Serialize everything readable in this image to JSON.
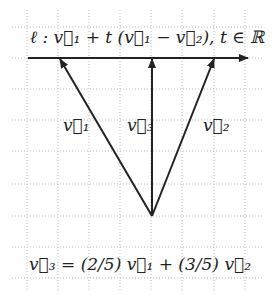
{
  "diagram": {
    "line_equation": "ℓ : v⃗₁ + t (v⃗₁ − v⃗₂), t ∈ ℝ",
    "labels": {
      "v1": "v⃗₁",
      "v2": "v⃗₂",
      "v3": "v⃗₃"
    },
    "relation": "v⃗₃ = (2/5) v⃗₁ + (3/5) v⃗₂",
    "grid": {
      "spacing_px": 31,
      "x_lines": [
        27,
        58,
        89,
        120,
        151,
        182,
        214,
        245
      ],
      "y_lines": [
        27,
        58,
        89,
        120,
        151,
        184,
        216,
        247,
        278
      ],
      "color": "#bbbbbb"
    },
    "origin": [
      152,
      216
    ],
    "vectors": [
      {
        "name": "v1",
        "tip": [
          60,
          58
        ]
      },
      {
        "name": "v3",
        "tip": [
          152,
          58
        ]
      },
      {
        "name": "v2",
        "tip": [
          214,
          58
        ]
      }
    ],
    "line_l": {
      "from": [
        28,
        58
      ],
      "to": [
        248,
        58
      ]
    },
    "ink_color": "#222222"
  }
}
